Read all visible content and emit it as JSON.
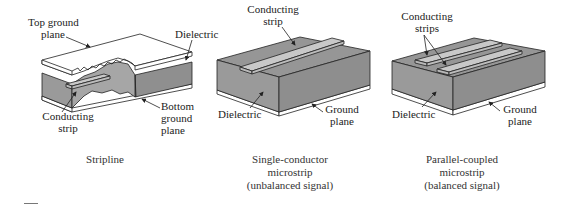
{
  "colors": {
    "dielectric": "#9a9a9a",
    "dielectric_side": "#8c8c8c",
    "strip": "#c8c8c8",
    "ground": "#ffffff",
    "line": "#222222"
  },
  "figures": [
    {
      "id": "stripline",
      "caption": [
        "Stripline"
      ],
      "labels": {
        "top_ground_plane": [
          "Top ground",
          "plane"
        ],
        "dielectric": "Dielectric",
        "bottom_ground_plane": [
          "Bottom",
          "ground",
          "plane"
        ],
        "conducting_strip": [
          "Conducting",
          "strip"
        ]
      }
    },
    {
      "id": "single-conductor-microstrip",
      "caption": [
        "Single-conductor",
        "microstrip",
        "(unbalanced signal)"
      ],
      "labels": {
        "conducting_strip": [
          "Conducting",
          "strip"
        ],
        "dielectric": "Dielectric",
        "ground_plane": [
          "Ground",
          "plane"
        ]
      }
    },
    {
      "id": "parallel-coupled-microstrip",
      "caption": [
        "Parallel-coupled",
        "microstrip",
        "(balanced signal)"
      ],
      "labels": {
        "conducting_strips": [
          "Conducting",
          "strips"
        ],
        "dielectric": "Dielectric",
        "ground_plane": [
          "Ground",
          "plane"
        ]
      }
    }
  ]
}
